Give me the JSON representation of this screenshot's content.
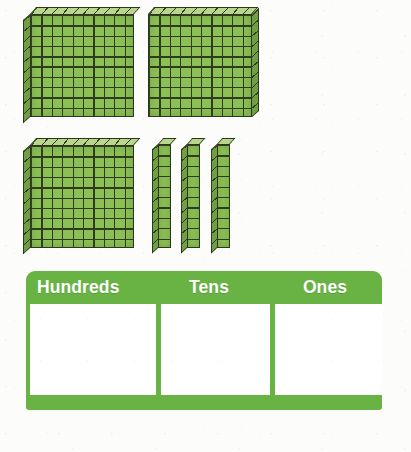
{
  "worksheet": {
    "title": "Base-ten blocks place value",
    "background_color": "#fcfcfa"
  },
  "manipulatives": {
    "block_color": "#8cbf55",
    "block_outline_color": "#2b3720",
    "hundreds_flats": [
      {
        "name": "hundreds-flat-1",
        "value": 100,
        "rows": 10,
        "cols": 10,
        "depth_side": "left",
        "x": 23,
        "y": 7
      },
      {
        "name": "hundreds-flat-2",
        "value": 100,
        "rows": 10,
        "cols": 10,
        "depth_side": "right",
        "x": 148,
        "y": 7
      },
      {
        "name": "hundreds-flat-3",
        "value": 100,
        "rows": 10,
        "cols": 10,
        "depth_side": "left",
        "x": 23,
        "y": 138
      }
    ],
    "tens_rods": [
      {
        "name": "tens-rod-1",
        "value": 10,
        "units": 10,
        "x": 152,
        "y": 138
      },
      {
        "name": "tens-rod-2",
        "value": 10,
        "units": 10,
        "x": 181,
        "y": 138
      },
      {
        "name": "tens-rod-3",
        "value": 10,
        "units": 10,
        "x": 211,
        "y": 138
      }
    ],
    "ones_cubes": [],
    "counts": {
      "hundreds": 3,
      "tens": 3,
      "ones": 0
    }
  },
  "place_value_table": {
    "accent_color": "#69b345",
    "header_text_color": "#ffffff",
    "cell_background": "#ffffff",
    "columns": [
      {
        "key": "hundreds",
        "header": "Hundreds",
        "value": ""
      },
      {
        "key": "tens",
        "header": "Tens",
        "value": ""
      },
      {
        "key": "ones",
        "header": "Ones",
        "value": ""
      }
    ]
  }
}
